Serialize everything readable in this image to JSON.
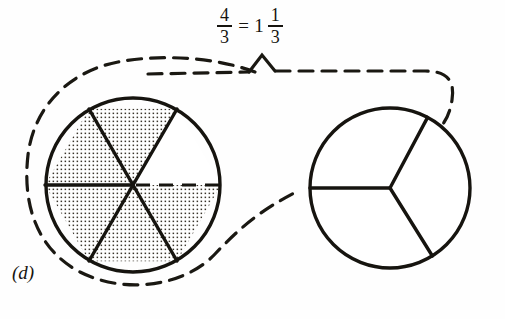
{
  "figure": {
    "label": "(d)",
    "equation": {
      "left_fraction": {
        "numerator": "4",
        "denominator": "3"
      },
      "equals": "=",
      "right_mixed": {
        "whole": "1",
        "numerator": "1",
        "denominator": "3"
      },
      "plain_text": "4/3 = 1 1/3"
    },
    "colors": {
      "ink": "#16140f",
      "shade_dot": "#3a352c",
      "paper": "#fefefe",
      "dashed": "#1a1812"
    },
    "circles": [
      {
        "name": "left-circle",
        "cx": 133,
        "cy": 185,
        "r": 88,
        "total_sectors": 6,
        "shaded_sectors": 5,
        "unshaded_sectors": 1,
        "fraction_shown": "5/6",
        "sector_shading": [
          true,
          true,
          true,
          true,
          true,
          false
        ],
        "radii_angles_deg": [
          180,
          240,
          300,
          0,
          60,
          120
        ],
        "dashed_radius_angle_deg": 0,
        "fill_pattern": "dot-grid"
      },
      {
        "name": "right-circle",
        "cx": 390,
        "cy": 188,
        "r": 80,
        "total_sectors": 3,
        "shaded_sectors": 0,
        "unshaded_sectors": 3,
        "fraction_shown": "0/3",
        "sector_shading": [
          false,
          false,
          false
        ],
        "radii_angles_deg": [
          180,
          302,
          62
        ],
        "fill_pattern": "none"
      }
    ],
    "dashed_loop": {
      "name": "dashed-enclosure",
      "description": "dashed loop encircling left circle and extending right to the right circle",
      "dash_pattern": "14 9"
    },
    "brace": {
      "name": "brace-peak",
      "description": "small peak in top dashed line beneath the equation"
    }
  }
}
